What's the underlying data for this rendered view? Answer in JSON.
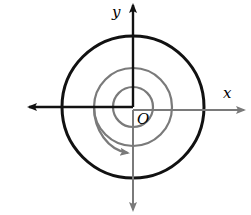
{
  "diagram": {
    "type": "angle-rotation",
    "labels": {
      "x_axis": "x",
      "y_axis": "y",
      "origin": "O"
    },
    "colors": {
      "primary_stroke": "#111111",
      "secondary_stroke": "#7a7a7a",
      "background": "#ffffff"
    }
  }
}
